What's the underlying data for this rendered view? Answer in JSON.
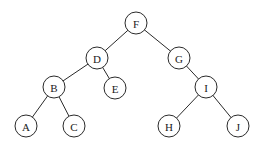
{
  "diagram": {
    "type": "binary-tree",
    "node_radius": 11,
    "colors": {
      "stroke": "#2a2a2a",
      "fill": "#ffffff",
      "text": "#1a1a1a"
    },
    "nodes": [
      {
        "id": "F",
        "label": "F",
        "x": 136,
        "y": 23
      },
      {
        "id": "D",
        "label": "D",
        "x": 97,
        "y": 58
      },
      {
        "id": "G",
        "label": "G",
        "x": 179,
        "y": 58
      },
      {
        "id": "B",
        "label": "B",
        "x": 54,
        "y": 87
      },
      {
        "id": "E",
        "label": "E",
        "x": 115,
        "y": 88
      },
      {
        "id": "I",
        "label": "I",
        "x": 206,
        "y": 87
      },
      {
        "id": "A",
        "label": "A",
        "x": 26,
        "y": 126
      },
      {
        "id": "C",
        "label": "C",
        "x": 74,
        "y": 126
      },
      {
        "id": "H",
        "label": "H",
        "x": 169,
        "y": 126
      },
      {
        "id": "J",
        "label": "J",
        "x": 238,
        "y": 126
      }
    ],
    "edges": [
      {
        "from": "F",
        "to": "D"
      },
      {
        "from": "F",
        "to": "G"
      },
      {
        "from": "D",
        "to": "B"
      },
      {
        "from": "D",
        "to": "E"
      },
      {
        "from": "G",
        "to": "I"
      },
      {
        "from": "B",
        "to": "A"
      },
      {
        "from": "B",
        "to": "C"
      },
      {
        "from": "I",
        "to": "H"
      },
      {
        "from": "I",
        "to": "J"
      }
    ]
  }
}
